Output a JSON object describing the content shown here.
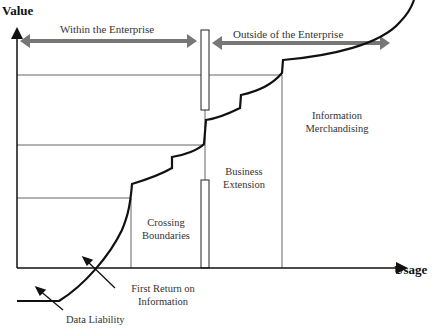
{
  "axes": {
    "y_label": "Value",
    "x_label": "Usage"
  },
  "zones": {
    "within": "Within the Enterprise",
    "outside": "Outside of the Enterprise"
  },
  "stages": {
    "crossing_l1": "Crossing",
    "crossing_l2": "Boundaries",
    "business_l1": "Business",
    "business_l2": "Extension",
    "merch_l1": "Information",
    "merch_l2": "Merchandising"
  },
  "annotations": {
    "first_return_l1": "First Return on",
    "first_return_l2": "Information",
    "data_liability": "Data Liability"
  },
  "colors": {
    "curve": "#111111",
    "arrow": "#777777",
    "grid": "#666666"
  }
}
